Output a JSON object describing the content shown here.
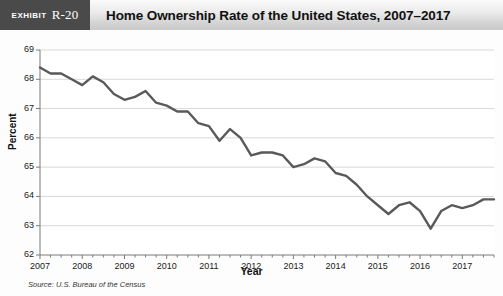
{
  "header": {
    "exhibit_word": "Exhibit",
    "exhibit_number": "R-20",
    "title": "Home Ownership Rate of the United States, 2007–2017"
  },
  "source": "Source: U.S. Bureau of the Census",
  "colors": {
    "line": "#595959",
    "grid": "#d9d9d9",
    "axis": "#7a7a7a",
    "header_tag_bg": "#4a4a4a",
    "plot_bg": "#ffffff"
  },
  "chart_data": {
    "type": "line",
    "title": "Home Ownership Rate of the United States, 2007–2017",
    "xlabel": "Year",
    "ylabel": "Percent",
    "ylim": [
      62,
      69
    ],
    "xlim": [
      2007,
      2017.75
    ],
    "ytick_labels": [
      "62",
      "63",
      "64",
      "65",
      "66",
      "67",
      "68",
      "69"
    ],
    "yticks": [
      62,
      63,
      64,
      65,
      66,
      67,
      68,
      69
    ],
    "xtick_labels": [
      "2007",
      "2008",
      "2009",
      "2010",
      "2011",
      "2012",
      "2013",
      "2014",
      "2015",
      "2016",
      "2017"
    ],
    "xticks": [
      2007,
      2008,
      2009,
      2010,
      2011,
      2012,
      2013,
      2014,
      2015,
      2016,
      2017
    ],
    "grid": true,
    "legend": false,
    "minor_ticks_per_year": 4,
    "series": [
      {
        "name": "Home ownership rate",
        "x": [
          2007.0,
          2007.25,
          2007.5,
          2007.75,
          2008.0,
          2008.25,
          2008.5,
          2008.75,
          2009.0,
          2009.25,
          2009.5,
          2009.75,
          2010.0,
          2010.25,
          2010.5,
          2010.75,
          2011.0,
          2011.25,
          2011.5,
          2011.75,
          2012.0,
          2012.25,
          2012.5,
          2012.75,
          2013.0,
          2013.25,
          2013.5,
          2013.75,
          2014.0,
          2014.25,
          2014.5,
          2014.75,
          2015.0,
          2015.25,
          2015.5,
          2015.75,
          2016.0,
          2016.25,
          2016.5,
          2016.75,
          2017.0,
          2017.25,
          2017.5,
          2017.75
        ],
        "values": [
          68.4,
          68.2,
          68.2,
          68.0,
          67.8,
          68.1,
          67.9,
          67.5,
          67.3,
          67.4,
          67.6,
          67.2,
          67.1,
          66.9,
          66.9,
          66.5,
          66.4,
          65.9,
          66.3,
          66.0,
          65.4,
          65.5,
          65.5,
          65.4,
          65.0,
          65.1,
          65.3,
          65.2,
          64.8,
          64.7,
          64.4,
          64.0,
          63.7,
          63.4,
          63.7,
          63.8,
          63.5,
          62.9,
          63.5,
          63.7,
          63.6,
          63.7,
          63.9,
          63.9
        ]
      }
    ]
  }
}
